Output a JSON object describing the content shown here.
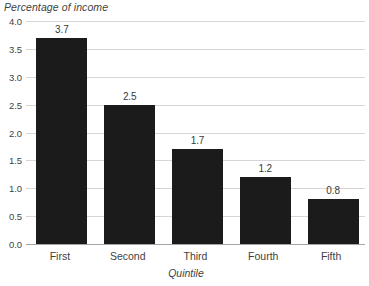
{
  "chart_data": {
    "type": "bar",
    "title": "",
    "ylabel": "Percentage of income",
    "xlabel": "Quintile",
    "categories": [
      "First",
      "Second",
      "Third",
      "Fourth",
      "Fifth"
    ],
    "values": [
      3.7,
      2.5,
      1.7,
      1.2,
      0.8
    ],
    "data_labels": [
      "3.7",
      "2.5",
      "1.7",
      "1.2",
      "0.8"
    ],
    "ylim": [
      0.0,
      4.0
    ],
    "ytick_labels": [
      "0.0",
      "0.5",
      "1.0",
      "1.5",
      "2.0",
      "2.5",
      "3.0",
      "3.5",
      "4.0"
    ],
    "ytick_values": [
      0.0,
      0.5,
      1.0,
      1.5,
      2.0,
      2.5,
      3.0,
      3.5,
      4.0
    ],
    "grid": "horizontal",
    "legend": "none",
    "bar_color": "#1b1b1b",
    "gridline_color": "#d6d6d6",
    "axis_color": "#a6a6a6",
    "background_color": "#ffffff",
    "text_color": "#3f3f3f"
  }
}
